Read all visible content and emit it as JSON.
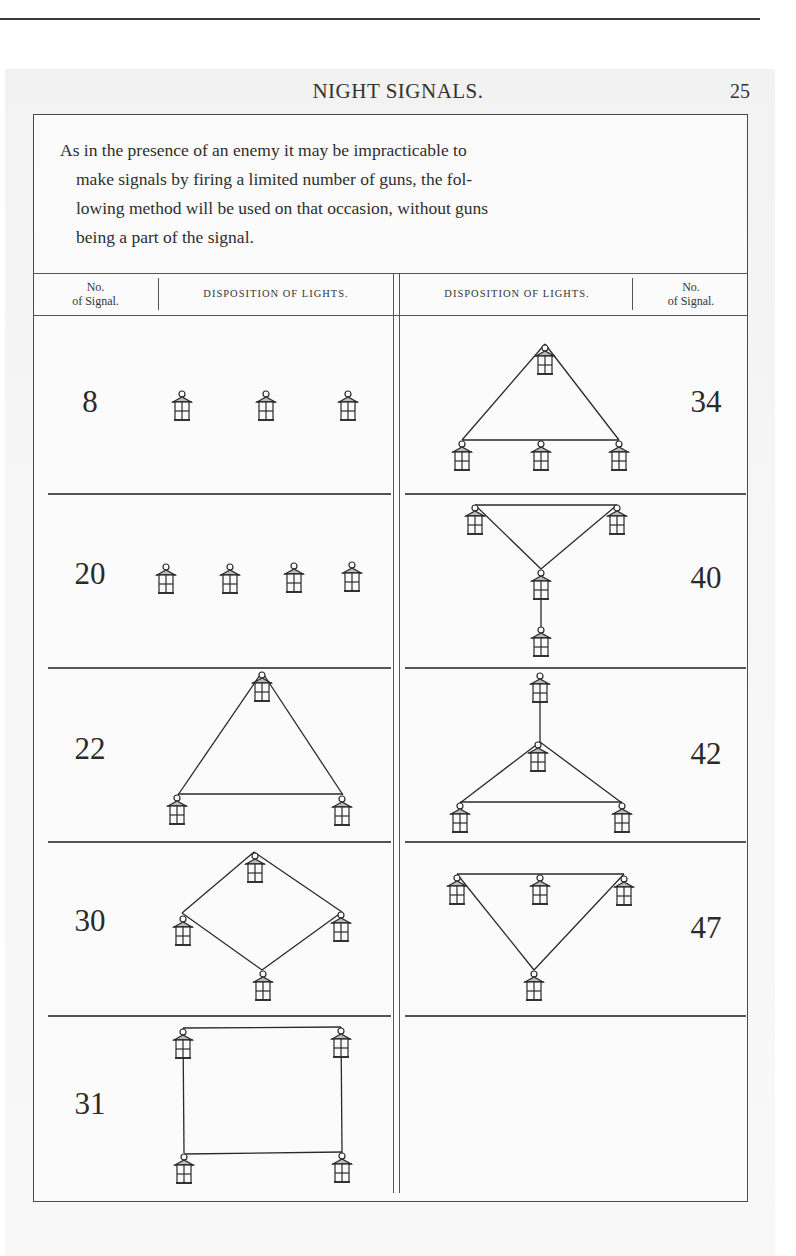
{
  "page": {
    "running_head": "NIGHT SIGNALS.",
    "page_number": "25"
  },
  "intro": {
    "lines": [
      "As in the presence of an enemy it may be impracticable to",
      "make signals by firing a limited number of guns, the fol-",
      "lowing method will be used on that occasion, without guns",
      "being a part of the signal."
    ]
  },
  "table": {
    "headers": {
      "left_no": "No. of Signal.",
      "left_no_line1": "No.",
      "left_no_line2": "of Signal.",
      "left_disp": "DISPOSITION OF LIGHTS.",
      "right_disp": "DISPOSITION OF LIGHTS.",
      "right_no_line1": "No.",
      "right_no_line2": "of Signal."
    },
    "left_column": [
      {
        "number": "8",
        "lanterns": 3,
        "arrangement": "three lanterns in a horizontal row"
      },
      {
        "number": "20",
        "lanterns": 4,
        "arrangement": "four lanterns in a horizontal row"
      },
      {
        "number": "22",
        "lanterns": 3,
        "arrangement": "triangle: one at top, two at bottom"
      },
      {
        "number": "30",
        "lanterns": 4,
        "arrangement": "diamond: top, left, right, bottom"
      },
      {
        "number": "31",
        "lanterns": 4,
        "arrangement": "square: two at top, two at bottom"
      }
    ],
    "right_column": [
      {
        "number": "34",
        "lanterns": 4,
        "arrangement": "triangle with one at apex and three along base"
      },
      {
        "number": "40",
        "lanterns": 4,
        "arrangement": "inverted triangle of three with one hanging below"
      },
      {
        "number": "42",
        "lanterns": 4,
        "arrangement": "one on top, triangle of three below with centre lantern"
      },
      {
        "number": "47",
        "lanterns": 4,
        "arrangement": "three across top, one at bottom point (inverted triangle)"
      },
      {
        "number": "",
        "lanterns": 0,
        "arrangement": "empty"
      }
    ]
  },
  "icons": {
    "lantern": "lantern-icon"
  }
}
